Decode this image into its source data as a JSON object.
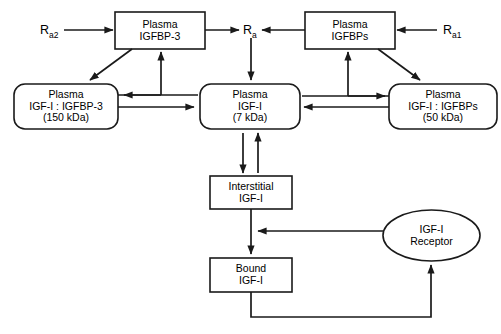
{
  "diagram": {
    "stroke_color": "#1a1a1a",
    "fill_color": "#ffffff",
    "nodes": [
      {
        "id": "plasma-igfbp3",
        "name": "plasma-igfbp3-box",
        "shape": "rect",
        "lines": [
          "Plasma",
          "IGFBP-3"
        ],
        "x": 115,
        "y": 12,
        "w": 90,
        "h": 37
      },
      {
        "id": "plasma-igfbps",
        "name": "plasma-igfbps-box",
        "shape": "rect",
        "lines": [
          "Plasma",
          "IGFBPs"
        ],
        "x": 305,
        "y": 12,
        "w": 90,
        "h": 37
      },
      {
        "id": "plasma-igf1-igfbp3",
        "name": "plasma-igf1-igfbp3-box",
        "shape": "roundrect",
        "lines": [
          "Plasma",
          "IGF-I : IGFBP-3",
          "(150 kDa)"
        ],
        "x": 14,
        "y": 84,
        "w": 104,
        "h": 45
      },
      {
        "id": "plasma-igf1",
        "name": "plasma-igf1-box",
        "shape": "roundrect",
        "lines": [
          "Plasma",
          "IGF-I",
          "(7 kDa)"
        ],
        "x": 200,
        "y": 84,
        "w": 100,
        "h": 45
      },
      {
        "id": "plasma-igf1-igfbps",
        "name": "plasma-igf1-igfbps-box",
        "shape": "roundrect",
        "lines": [
          "Plasma",
          "IGF-I : IGFBPs",
          "(50 kDa)"
        ],
        "x": 389,
        "y": 84,
        "w": 108,
        "h": 45
      },
      {
        "id": "interstitial-igf1",
        "name": "interstitial-igf1-box",
        "shape": "rect",
        "lines": [
          "Interstitial",
          "IGF-I"
        ],
        "x": 210,
        "y": 176,
        "w": 82,
        "h": 33
      },
      {
        "id": "bound-igf1",
        "name": "bound-igf1-box",
        "shape": "rect",
        "lines": [
          "Bound",
          "IGF-I"
        ],
        "x": 210,
        "y": 258,
        "w": 82,
        "h": 34
      },
      {
        "id": "igf1-receptor",
        "name": "igf1-receptor-ellipse",
        "shape": "ellipse",
        "lines": [
          "IGF-I",
          "Receptor"
        ],
        "x": 383,
        "y": 210,
        "w": 97,
        "h": 51
      }
    ],
    "rate_labels": [
      {
        "id": "ra2",
        "name": "rate-label-ra2",
        "base": "R",
        "sub": "a2",
        "x": 40,
        "y": 24
      },
      {
        "id": "ra",
        "name": "rate-label-ra",
        "base": "R",
        "sub": "a",
        "x": 243,
        "y": 24
      },
      {
        "id": "ra1",
        "name": "rate-label-ra1",
        "base": "R",
        "sub": "a1",
        "x": 443,
        "y": 24
      }
    ],
    "edges": [
      {
        "name": "edge-ra2-to-plasma-igfbp3",
        "from": "Ra2",
        "to": "Plasma IGFBP-3",
        "style": "arrow-right"
      },
      {
        "name": "edge-plasma-igfbp3-to-ra",
        "from": "Plasma IGFBP-3",
        "to": "Ra",
        "style": "arrow-right"
      },
      {
        "name": "edge-ra1-to-plasma-igfbps",
        "from": "Ra1",
        "to": "Plasma IGFBPs",
        "style": "arrow-left"
      },
      {
        "name": "edge-plasma-igfbps-to-ra",
        "from": "Plasma IGFBPs",
        "to": "Ra",
        "style": "arrow-left"
      },
      {
        "name": "edge-plasma-igfbp3-to-complex150",
        "from": "Plasma IGFBP-3",
        "to": "Plasma IGF-I : IGFBP-3",
        "style": "diagonal-arrow"
      },
      {
        "name": "edge-plasma-igfbps-to-complex50",
        "from": "Plasma IGFBPs",
        "to": "Plasma IGF-I : IGFBPs",
        "style": "diagonal-arrow"
      },
      {
        "name": "edge-ra-to-plasma-igf1",
        "from": "Ra",
        "to": "Plasma IGF-I",
        "style": "arrow-down"
      },
      {
        "name": "edge-complex150-to-plasma-igfbp3",
        "from": "Plasma IGF-I : IGFBP-3",
        "to": "Plasma IGFBP-3",
        "style": "arrow-up"
      },
      {
        "name": "edge-complex50-to-plasma-igfbps",
        "from": "Plasma IGF-I : IGFBPs",
        "to": "Plasma IGFBPs",
        "style": "arrow-up"
      },
      {
        "name": "edge-complex150-to-plasma-igf1",
        "from": "Plasma IGF-I : IGFBP-3",
        "to": "Plasma IGF-I",
        "style": "arrow-right"
      },
      {
        "name": "edge-plasma-igf1-to-complex150",
        "from": "Plasma IGF-I",
        "to": "Plasma IGF-I : IGFBP-3",
        "style": "arrow-left"
      },
      {
        "name": "edge-plasma-igf1-to-complex50",
        "from": "Plasma IGF-I",
        "to": "Plasma IGF-I : IGFBPs",
        "style": "arrow-right"
      },
      {
        "name": "edge-complex50-to-plasma-igf1",
        "from": "Plasma IGF-I : IGFBPs",
        "to": "Plasma IGF-I",
        "style": "arrow-left"
      },
      {
        "name": "edge-plasma-igf1-to-interstitial",
        "from": "Plasma IGF-I",
        "to": "Interstitial IGF-I",
        "style": "arrow-down"
      },
      {
        "name": "edge-interstitial-to-plasma-igf1",
        "from": "Interstitial IGF-I",
        "to": "Plasma IGF-I",
        "style": "arrow-up"
      },
      {
        "name": "edge-interstitial-to-bound",
        "from": "Interstitial IGF-I",
        "to": "Bound IGF-I",
        "style": "arrow-down"
      },
      {
        "name": "edge-receptor-to-interstitial",
        "from": "IGF-I Receptor",
        "to": "Interstitial IGF-I",
        "style": "arrow-left"
      },
      {
        "name": "edge-bound-to-receptor",
        "from": "Bound IGF-I",
        "to": "IGF-I Receptor",
        "style": "feedback-arrow-up"
      }
    ]
  }
}
